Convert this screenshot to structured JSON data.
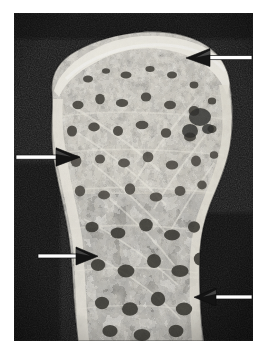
{
  "figure": {
    "kind": "photomicrograph",
    "title": "",
    "caption": "",
    "plate": {
      "background_color": "#141414",
      "paper_color": "#ffffff",
      "left": 14,
      "top": 13,
      "width": 239,
      "height": 328
    },
    "palette": {
      "paper": "#ffffff",
      "plate_background": "#141414",
      "background_dark": "#1d1d1d",
      "background_darkest": "#0d0d0d",
      "bone_bright": "#f4f1ea",
      "bone_light": "#ddd8cd",
      "bone_mid": "#b9b3a6",
      "bone_shadow": "#8d887c",
      "marrow_dark": "#2e2c28",
      "marrow_mid": "#4a4741",
      "cortex_edge": "#6a655c",
      "arrow_white": "#ffffff",
      "arrow_dark": "#121212"
    },
    "specimen": {
      "label": "trabecular-bone-section",
      "regions": [
        {
          "name": "subchondral-plate",
          "location": "superior margin",
          "tone": "bright"
        },
        {
          "name": "epiphyseal-trabecular-mesh",
          "location": "upper two thirds",
          "tone": "mixed"
        },
        {
          "name": "metaphyseal-trabeculae",
          "location": "lower third",
          "tone": "coarse"
        },
        {
          "name": "cortical-rim-left",
          "location": "left margin",
          "tone": "bright"
        },
        {
          "name": "cortical-rim-right",
          "location": "right margin",
          "tone": "bright"
        }
      ]
    },
    "annotations": {
      "count": 4,
      "style": "white-filled-arrow-with-dark-outline",
      "arrows": [
        {
          "id": "arrow-1",
          "label": "arrow-superior-right",
          "direction": "left",
          "tail_x": 236,
          "tail_y": 45,
          "head_x": 186,
          "head_y": 45,
          "points_to": "superior cortical surface defect"
        },
        {
          "id": "arrow-2",
          "label": "arrow-mid-left",
          "direction": "right",
          "tail_x": 14,
          "tail_y": 157,
          "head_x": 60,
          "head_y": 157,
          "points_to": "left cortical thinning"
        },
        {
          "id": "arrow-3",
          "label": "arrow-lower-left",
          "direction": "right",
          "tail_x": 36,
          "tail_y": 256,
          "head_x": 80,
          "head_y": 256,
          "points_to": "metaphyseal cortical step"
        },
        {
          "id": "arrow-4",
          "label": "arrow-lower-right",
          "direction": "left",
          "tail_x": 244,
          "tail_y": 297,
          "head_x": 207,
          "head_y": 297,
          "points_to": "inferior right cortical margin"
        }
      ]
    }
  }
}
